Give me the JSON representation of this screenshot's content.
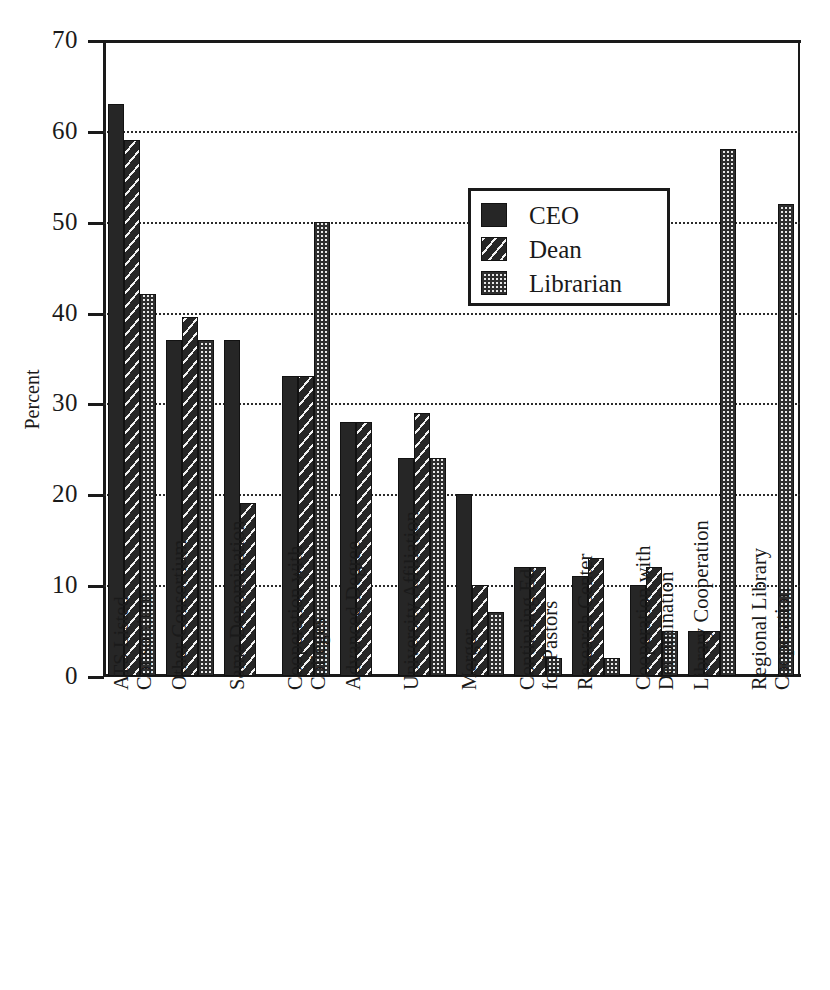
{
  "chart_data": {
    "type": "bar",
    "title": "",
    "xlabel": "",
    "ylabel": "Percent",
    "ylim": [
      0,
      70
    ],
    "yticks": [
      0,
      10,
      20,
      30,
      40,
      50,
      60,
      70
    ],
    "grid": true,
    "legend_position": "upper-center-right",
    "categories": [
      "ATS Listed\nConsortium",
      "Other Consortium",
      "Same Denomination",
      "Cooperation with\nColleges",
      "Advanced Degree",
      "University Affiliation",
      "Merger",
      "Continuing Ed\nfor Pastors",
      "Research Center",
      "Cooperation with\nDenomination",
      "Library Cooperation",
      "Regional Library\nCooperation"
    ],
    "categories_lines": [
      [
        "ATS Listed",
        "Consortium"
      ],
      [
        "Other Consortium"
      ],
      [
        "Same Denomination"
      ],
      [
        "Cooperation with",
        "Colleges"
      ],
      [
        "Advanced Degree"
      ],
      [
        "University Affiliation"
      ],
      [
        "Merger"
      ],
      [
        "Continuing Ed",
        "for Pastors"
      ],
      [
        "Research Center"
      ],
      [
        "Cooperation with",
        "Denomination"
      ],
      [
        "Library Cooperation"
      ],
      [
        "Regional Library",
        "Cooperation"
      ]
    ],
    "series": [
      {
        "name": "CEO",
        "pattern": "solid",
        "values": [
          63,
          37,
          37,
          33,
          28,
          24,
          20,
          12,
          11,
          10,
          5,
          0
        ]
      },
      {
        "name": "Dean",
        "pattern": "hatch",
        "values": [
          59,
          39.5,
          19,
          33,
          28,
          29,
          10,
          12,
          13,
          12,
          5,
          0
        ]
      },
      {
        "name": "Librarian",
        "pattern": "dots",
        "values": [
          42,
          37,
          0,
          50,
          0,
          24,
          7,
          2,
          2,
          5,
          58,
          52
        ]
      }
    ]
  },
  "legend": {
    "items": [
      {
        "label": "CEO",
        "pattern": "solid"
      },
      {
        "label": "Dean",
        "pattern": "hatch"
      },
      {
        "label": "Librarian",
        "pattern": "dots"
      }
    ]
  },
  "axes": {
    "y_label": "Percent",
    "y_tick_labels": [
      "70",
      "60",
      "50",
      "40",
      "30",
      "20",
      "10",
      "0"
    ]
  }
}
